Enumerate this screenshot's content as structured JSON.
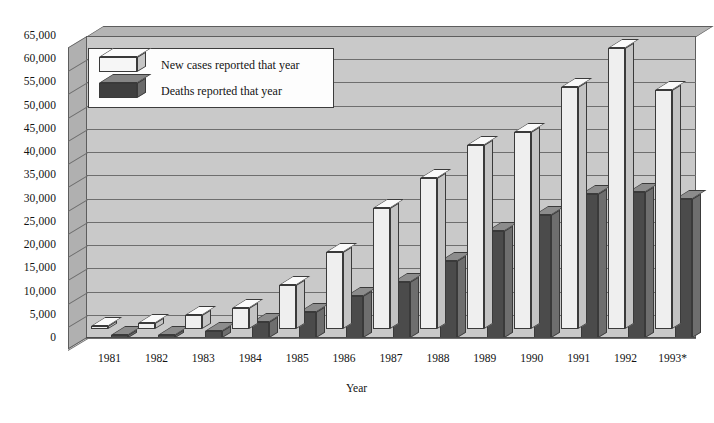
{
  "chart_data": {
    "type": "bar",
    "title": "",
    "subtitle": "",
    "xlabel": "Year",
    "ylabel": "",
    "categories": [
      "1981",
      "1982",
      "1983",
      "1984",
      "1985",
      "1986",
      "1987",
      "1988",
      "1989",
      "1990",
      "1991",
      "1992",
      "1993*"
    ],
    "series": [
      {
        "name": "New cases reported that year",
        "color": "#efefef",
        "values": [
          300,
          1200,
          3100,
          4500,
          9500,
          16500,
          26000,
          32500,
          39500,
          42500,
          52000,
          60500,
          51500
        ]
      },
      {
        "name": "Deaths reported that year",
        "color": "#4b4b4b",
        "values": [
          150,
          500,
          1500,
          3500,
          5500,
          9000,
          12000,
          16500,
          23000,
          26500,
          31000,
          31500,
          30000
        ]
      }
    ],
    "ylim": [
      0,
      65000
    ],
    "ytick_step": 5000,
    "yticks": [
      "65,000",
      "60,000",
      "55,000",
      "50,000",
      "45,000",
      "40,000",
      "35,000",
      "30,000",
      "25,000",
      "20,000",
      "15,000",
      "10,000",
      "5,000",
      "0"
    ],
    "grid": true,
    "legend_position": "upper-left",
    "style": "3d-column",
    "footnote_marker": "*"
  },
  "legend": {
    "items": [
      {
        "label": "New cases reported that year",
        "swatch": "light-box-icon"
      },
      {
        "label": "Deaths reported that year",
        "swatch": "dark-box-icon"
      }
    ]
  },
  "axes": {
    "x_title": "Year"
  }
}
